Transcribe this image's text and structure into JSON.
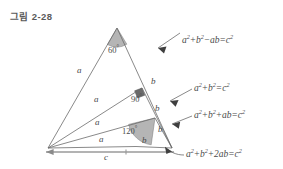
{
  "figure": {
    "title": "그림 2-28"
  },
  "colors": {
    "line": "#6b6b6b",
    "base_line": "#9a9a9a",
    "sector_fill": "#b5b5b5",
    "right_angle_fill": "#6a6a6a",
    "text": "#4a4a4a",
    "title_text": "#5a5a5a",
    "background": "#ffffff"
  },
  "formulas": [
    {
      "id": "formula-1",
      "text": "a² + b² − ab = c²",
      "parts": {
        "a_base": "a",
        "a_exp": "2",
        "op1": "+",
        "b_base": "b",
        "b_exp": "2",
        "op2": "−",
        "term": "ab",
        "eq": "=",
        "c_base": "c",
        "c_exp": "2"
      }
    },
    {
      "id": "formula-2",
      "text": "a² + b² = c²",
      "parts": {
        "a_base": "a",
        "a_exp": "2",
        "op1": "+",
        "b_base": "b",
        "b_exp": "2",
        "eq": "=",
        "c_base": "c",
        "c_exp": "2"
      }
    },
    {
      "id": "formula-3",
      "text": "a² + b² + ab = c²",
      "parts": {
        "a_base": "a",
        "a_exp": "2",
        "op1": "+",
        "b_base": "b",
        "b_exp": "2",
        "op2": "+",
        "term": "ab",
        "eq": "=",
        "c_base": "c",
        "c_exp": "2"
      }
    },
    {
      "id": "formula-4",
      "text": "a² + b² + 2ab = c²",
      "parts": {
        "a_base": "a",
        "a_exp": "2",
        "op1": "+",
        "b_base": "b",
        "b_exp": "2",
        "op2": "+",
        "term": "2ab",
        "eq": "=",
        "c_base": "c",
        "c_exp": "2"
      }
    }
  ],
  "angles": [
    {
      "id": "angle-60",
      "value": "60",
      "degree_symbol": "°"
    },
    {
      "id": "angle-90",
      "value": "90",
      "degree_symbol": "°"
    },
    {
      "id": "angle-120",
      "value": "120",
      "degree_symbol": "°"
    }
  ],
  "side_labels": {
    "a_1": "a",
    "a_2": "a",
    "a_3": "a",
    "a_4": "a",
    "b_1": "b",
    "b_2": "b",
    "b_3": "b",
    "b_4": "b",
    "c": "c"
  },
  "geometry": {
    "left_vertex": {
      "x": 48,
      "y": 148
    },
    "right_vertex": {
      "x": 172,
      "y": 148
    },
    "apexes": [
      {
        "x": 117,
        "y": 28,
        "angle": "60"
      },
      {
        "x": 142,
        "y": 88,
        "angle": "90"
      },
      {
        "x": 155,
        "y": 118,
        "angle": "120"
      }
    ]
  }
}
